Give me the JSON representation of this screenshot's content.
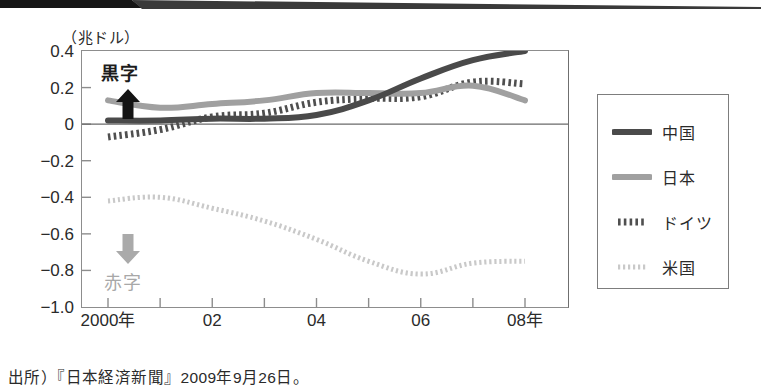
{
  "figure": {
    "unit_label": "（兆ドル）",
    "source_note": "出所）『日本経済新聞』2009年9月26日。",
    "annotations": {
      "surplus_label": "黒字",
      "surplus_arrow_icon": "arrow-up-icon",
      "deficit_label": "赤字",
      "deficit_arrow_icon": "arrow-down-icon"
    }
  },
  "colors": {
    "china": "#4a4a4a",
    "japan": "#a0a0a0",
    "germany": "#4f4f4f",
    "usa": "#c9c9c9",
    "axis": "#8d8d8d",
    "text": "#2a2a2a",
    "deficit_text": "#a8a8a8",
    "frame": "#7d7d7d"
  },
  "chart_data": {
    "type": "line",
    "title": "",
    "subtitle": "",
    "xlabel": "",
    "ylabel": "（兆ドル）",
    "ylim": [
      -1.0,
      0.4
    ],
    "xlim": [
      2000,
      2008
    ],
    "grid": false,
    "zero_line": true,
    "legend_position": "right-outside",
    "ytick_labels": [
      "0.4",
      "0.2",
      "0",
      "-0.2",
      "-0.4",
      "-0.6",
      "-0.8",
      "-1.0"
    ],
    "ytick_values": [
      0.4,
      0.2,
      0,
      -0.2,
      -0.4,
      -0.6,
      -0.8,
      -1.0
    ],
    "xtick_labels": [
      "2000年",
      "02",
      "04",
      "06",
      "08年"
    ],
    "xtick_values": [
      2000,
      2002,
      2004,
      2006,
      2008
    ],
    "x_minor_ticks": [
      2001,
      2003,
      2005,
      2007
    ],
    "x": [
      2000,
      2001,
      2002,
      2003,
      2004,
      2005,
      2006,
      2007,
      2008
    ],
    "series": [
      {
        "name": "中国",
        "key": "china",
        "style": "solid-thick",
        "color": "#4a4a4a",
        "values": [
          0.02,
          0.02,
          0.03,
          0.03,
          0.05,
          0.13,
          0.25,
          0.35,
          0.4
        ]
      },
      {
        "name": "日本",
        "key": "japan",
        "style": "solid-thick",
        "color": "#a0a0a0",
        "values": [
          0.13,
          0.09,
          0.11,
          0.13,
          0.17,
          0.17,
          0.17,
          0.21,
          0.13
        ]
      },
      {
        "name": "ドイツ",
        "key": "germany",
        "style": "dotted-dense",
        "color": "#4f4f4f",
        "values": [
          -0.07,
          -0.03,
          0.04,
          0.06,
          0.12,
          0.14,
          0.15,
          0.23,
          0.22
        ]
      },
      {
        "name": "米国",
        "key": "usa",
        "style": "dotted-fine",
        "color": "#c9c9c9",
        "values": [
          -0.42,
          -0.4,
          -0.46,
          -0.53,
          -0.63,
          -0.75,
          -0.82,
          -0.76,
          -0.75
        ]
      }
    ]
  },
  "legend": {
    "items": [
      {
        "label": "中国",
        "swatch": "solid-thick-dark"
      },
      {
        "label": "日本",
        "swatch": "solid-thick-gray"
      },
      {
        "label": "ドイツ",
        "swatch": "dotted-dense-dark"
      },
      {
        "label": "米国",
        "swatch": "dotted-fine-light"
      }
    ]
  }
}
